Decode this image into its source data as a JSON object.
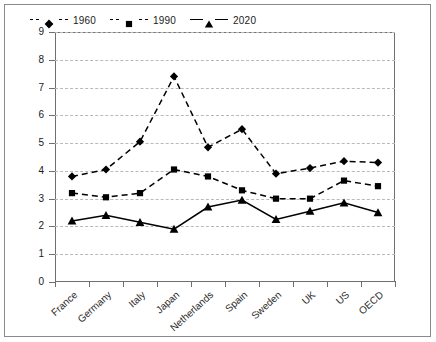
{
  "chart_data": {
    "type": "line",
    "title": "",
    "xlabel": "",
    "ylabel": "",
    "ylim": [
      0,
      9
    ],
    "yticks": [
      0,
      1,
      2,
      3,
      4,
      5,
      6,
      7,
      8,
      9
    ],
    "grid": true,
    "legend_position": "top-left",
    "categories": [
      "France",
      "Germany",
      "Italy",
      "Japan",
      "Netherlands",
      "Spain",
      "Sweden",
      "UK",
      "US",
      "OECD"
    ],
    "series": [
      {
        "name": "1960",
        "marker": "diamond",
        "line_style": "dashed",
        "color": "#000000",
        "values": [
          3.8,
          4.05,
          5.05,
          7.4,
          4.85,
          5.5,
          3.9,
          4.1,
          4.35,
          4.3
        ]
      },
      {
        "name": "1990",
        "marker": "square",
        "line_style": "dashed",
        "color": "#000000",
        "values": [
          3.2,
          3.05,
          3.2,
          4.05,
          3.8,
          3.3,
          3.0,
          3.0,
          3.65,
          3.45
        ]
      },
      {
        "name": "2020",
        "marker": "triangle",
        "line_style": "solid",
        "color": "#000000",
        "values": [
          2.2,
          2.4,
          2.15,
          1.9,
          2.7,
          2.95,
          2.25,
          2.55,
          2.85,
          2.5
        ]
      }
    ]
  },
  "axis": {
    "y_tick_labels": [
      "0",
      "1",
      "2",
      "3",
      "4",
      "5",
      "6",
      "7",
      "8",
      "9"
    ],
    "x_tick_labels": [
      "France",
      "Germany",
      "Italy",
      "Japan",
      "Netherlands",
      "Spain",
      "Sweden",
      "UK",
      "US",
      "OECD"
    ]
  },
  "legend": {
    "items": [
      {
        "label": "1960"
      },
      {
        "label": "1990"
      },
      {
        "label": "2020"
      }
    ]
  }
}
